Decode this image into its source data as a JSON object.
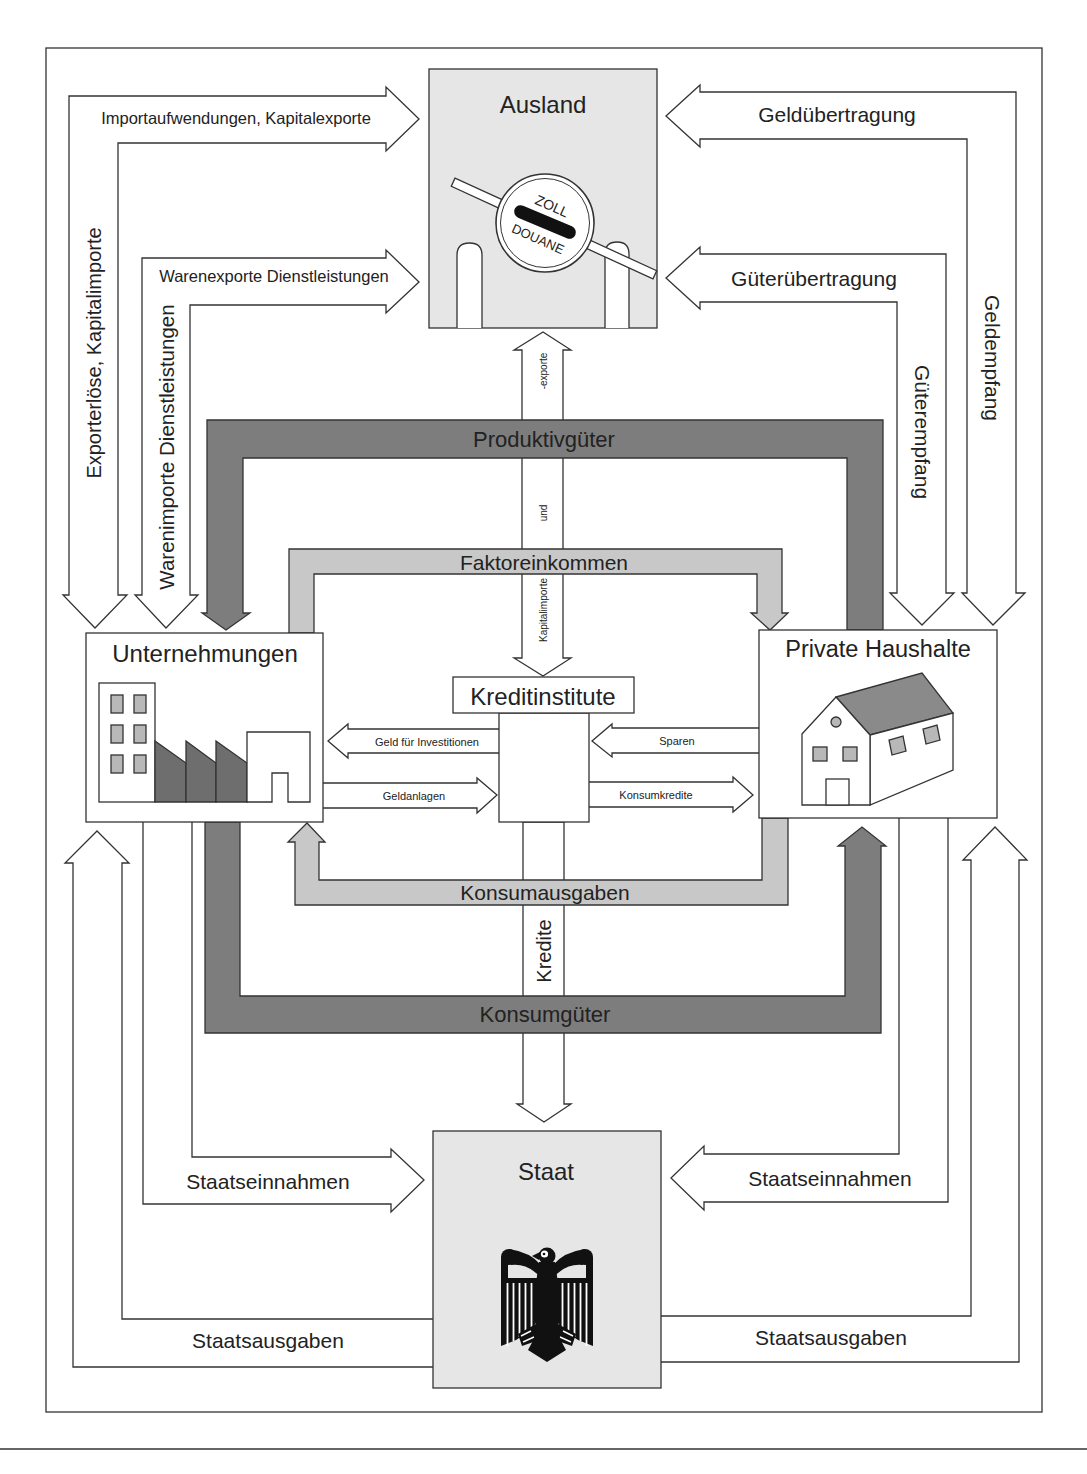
{
  "diagram": {
    "colors": {
      "stroke": "#333333",
      "box_fill": "#e6e6e6",
      "dark_band": "#7d7d7d",
      "light_band": "#c8c8c8",
      "window_fill": "#b8b8b8",
      "shed_fill": "#6e6e6e",
      "roof_fill": "#8a8a8a",
      "eagle_fill": "#111111"
    },
    "sectors": {
      "ausland": {
        "label": "Ausland",
        "icon": "customs-barrier-icon",
        "sign_top": "ZOLL",
        "sign_bottom": "DOUANE"
      },
      "unternehmungen": {
        "label": "Unternehmungen",
        "icon": "factory-icon"
      },
      "private_haushalte": {
        "label": "Private Haushalte",
        "icon": "house-icon"
      },
      "kreditinstitute": {
        "label": "Kreditinstitute"
      },
      "staat": {
        "label": "Staat",
        "icon": "federal-eagle-icon"
      }
    },
    "flows": {
      "importaufwendungen": {
        "label": "Importaufwendungen, Kapitalexporte",
        "from": "Unternehmungen",
        "to": "Ausland"
      },
      "exporterloese": {
        "label": "Exporterlöse, Kapitalimporte",
        "from": "Ausland",
        "to": "Unternehmungen"
      },
      "warenexporte": {
        "label": "Warenexporte Dienstleistungen",
        "from": "Unternehmungen",
        "to": "Ausland"
      },
      "warenimporte": {
        "label": "Warenimporte Dienstleistungen",
        "from": "Ausland",
        "to": "Unternehmungen"
      },
      "gelduebertragung": {
        "label": "Geldübertragung",
        "from": "Private Haushalte",
        "to": "Ausland"
      },
      "geldempfang": {
        "label": "Geldempfang",
        "from": "Ausland",
        "to": "Private Haushalte"
      },
      "gueteruebertragung": {
        "label": "Güterübertragung",
        "from": "Private Haushalte",
        "to": "Ausland"
      },
      "gueterempfang": {
        "label": "Güterempfang",
        "from": "Ausland",
        "to": "Private Haushalte"
      },
      "kapitalverkehr": {
        "label_top": "-exporte",
        "label_middle": "und",
        "label_bottom": "Kapitalimporte",
        "between": [
          "Ausland",
          "Kreditinstitute"
        ]
      },
      "produktivgueter": {
        "label": "Produktivgüter",
        "from": "Private Haushalte",
        "to": "Unternehmungen"
      },
      "faktoreinkommen": {
        "label": "Faktoreinkommen",
        "from": "Unternehmungen",
        "to": "Private Haushalte"
      },
      "geld_fuer_investitionen": {
        "label": "Geld für Investitionen",
        "from": "Kreditinstitute",
        "to": "Unternehmungen"
      },
      "geldanlagen": {
        "label": "Geldanlagen",
        "from": "Unternehmungen",
        "to": "Kreditinstitute"
      },
      "sparen": {
        "label": "Sparen",
        "from": "Private Haushalte",
        "to": "Kreditinstitute"
      },
      "konsumkredite": {
        "label": "Konsumkredite",
        "from": "Kreditinstitute",
        "to": "Private Haushalte"
      },
      "konsumausgaben": {
        "label": "Konsumausgaben",
        "from": "Private Haushalte",
        "to": "Unternehmungen"
      },
      "konsumgueter": {
        "label": "Konsumgüter",
        "from": "Unternehmungen",
        "to": "Private Haushalte"
      },
      "kredite": {
        "label": "Kredite",
        "from": "Kreditinstitute",
        "to": "Staat"
      },
      "staatseinnahmen_unternehmungen": {
        "label": "Staatseinnahmen",
        "from": "Unternehmungen",
        "to": "Staat"
      },
      "staatseinnahmen_haushalte": {
        "label": "Staatseinnahmen",
        "from": "Private Haushalte",
        "to": "Staat"
      },
      "staatsausgaben_unternehmungen": {
        "label": "Staatsausgaben",
        "from": "Staat",
        "to": "Unternehmungen"
      },
      "staatsausgaben_haushalte": {
        "label": "Staatsausgaben",
        "from": "Staat",
        "to": "Private Haushalte"
      }
    }
  }
}
